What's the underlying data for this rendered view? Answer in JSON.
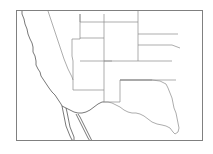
{
  "figure": {
    "type": "thematic-map",
    "title": "",
    "region_label": "Western United States",
    "width": 213,
    "height": 154,
    "background_color": "#ffffff"
  },
  "frame": {
    "name": "map-border-frame",
    "x": 16,
    "y": 10,
    "width": 187,
    "height": 131,
    "stroke_color": "#808080",
    "stroke_width": 1,
    "fill_color": "#ffffff"
  },
  "style": {
    "state_boundary_color": "#8a8a8a",
    "coastline_color": "#555555",
    "international_border_color": "#555555",
    "highlight_fill": "#d9d9d9",
    "highlight_stroke": "none",
    "line_width": 0.7
  },
  "highlight": {
    "name": "shaded-study-area",
    "label": "shaded region",
    "fill_color": "#d9d9d9",
    "description": "Shaded area over eastern Nebraska, eastern Kansas and western Missouri",
    "approx_bounds": {
      "x": 170,
      "y": 26,
      "width": 34,
      "height": 48
    }
  },
  "features": {
    "coastline_pacific": "Pacific coastline of California, Oregon and Baja California",
    "baja_peninsula": "Baja California peninsula and Gulf of California",
    "texas_outline": "Texas state outline with Gulf coast",
    "state_grid": "Interior western state boundaries"
  },
  "paths": {
    "pacific_coast": "M 22 11 L 22 14 L 24 19 L 25 24 L 27 29 L 28 34 L 30 39 L 32 43 L 33 47 L 33 52 L 35 56 L 36 61 L 36 65 L 38 69 L 40 72 L 41 76 L 43 79 L 45 82 L 47 85 L 49 88 L 52 92 L 55 95 L 57 98 L 59 101 L 61 104 L 62 106",
    "ca_nv_border": "M 48 11 L 50 17 L 52 23 L 54 29 L 56 35 L 58 41 L 60 47 L 62 53 L 64 59 L 66 64 L 68 69 L 70 73 L 72 77 L 73 80",
    "nv_ut_border": "M 72 39 L 80 39 L 80 30 L 80 22 L 80 14",
    "nv_az_border": "M 72 39 L 72 48 L 72 56 L 73 61 L 73 66",
    "ut_border_s": "M 80 61 L 92 61 L 104 61 L 112 61",
    "ut_co_border": "M 104 22 L 104 38 L 104 50 L 104 61",
    "wy_ut_border": "M 80 38 L 92 38 L 104 38",
    "id_wy_border": "M 80 22 L 90 22 L 100 22 L 104 22 L 104 14",
    "id_mt_border": "M 80 14 L 80 22",
    "mt_wy_border": "M 104 22 L 118 22 L 132 22 L 138 22",
    "mt_nd_border": "M 138 11 L 138 22",
    "wy_sd_border": "M 138 22 L 138 34 L 138 45",
    "nd_sd_border": "M 138 34 L 152 34 L 166 34 L 178 34",
    "sd_ne_border": "M 138 45 L 150 45 L 162 45 L 172 45 L 180 48",
    "co_ne_kansas": "M 104 61 L 118 61 L 132 61 L 140 61 L 150 61 L 162 61",
    "co_nm_border": "M 104 61 L 104 70 L 104 80 L 104 88",
    "nm_az_border": "M 73 66 L 73 74 L 73 82 L 73 90",
    "az_nm_south": "M 73 90 L 86 90 L 98 90 L 104 90",
    "nm_tx_border": "M 104 88 L 104 96 L 104 102 L 110 102 L 116 102 L 120 102",
    "ok_tx_panhandle": "M 120 80 L 132 80 L 144 80 L 152 80",
    "ks_ok_border": "M 120 80 L 132 80 L 144 80 L 156 80 L 168 80 L 176 80",
    "wy_co_ne_vert": "M 138 45 L 138 53 L 138 61",
    "ne_ks_vertical": "M 162 61 L 172 61",
    "texas_outline": "M 120 102 L 120 96 L 120 90 L 120 84 L 120 80 L 128 80 L 136 80 L 144 80 L 152 80 L 160 81 L 166 84 L 168 88 L 170 93 L 172 98 L 173 103 L 174 108 L 176 113 L 177 118 L 178 123 L 179 128 L 178 132 L 175 134 L 173 132 L 170 128 L 166 126 L 162 125 L 157 124 L 152 122 L 148 119 L 144 116 L 140 114 L 136 113 L 132 113 L 128 112 L 124 110 L 120 107 L 116 105 L 112 103 L 108 102 L 104 102",
    "mexico_border_west": "M 62 106 L 66 108 L 70 110 L 74 112 L 78 113 L 82 113 L 86 112 L 90 110 L 94 107 L 98 104 L 102 102 L 104 102",
    "baja_outline": "M 62 106 L 63 111 L 64 116 L 65 121 L 66 126 L 68 131 L 70 136 L 72 140 L 74 141 L 74 137 L 72 132 L 70 127 L 69 122 L 68 117 L 67 112 L 66 108",
    "gulf_california": "M 76 114 L 78 118 L 80 122 L 82 126 L 84 130 L 86 134 L 88 138 L 90 141 L 92 141 L 90 137 L 88 133 L 86 129 L 84 125 L 82 121 L 80 117 L 78 114",
    "highlight_shape": "M 176 27 L 182 26 L 189 28 L 195 33 L 199 40 L 201 48 L 202 56 L 201 63 L 198 69 L 193 73 L 187 74 L 181 72 L 177 68 L 174 62 L 172 55 L 171 47 L 172 39 L 174 32 Z"
  }
}
